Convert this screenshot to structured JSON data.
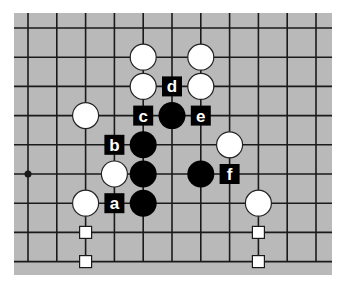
{
  "diagram": {
    "type": "go-board-fragment",
    "grid": {
      "columns": 11,
      "rows": 9
    },
    "colors": {
      "board": "#b9b9b9",
      "line": "#1a1a1a",
      "black_stone": "#000000",
      "white_stone": "#ffffff",
      "label_bg": "#000000",
      "label_text": "#ffffff",
      "marker_fill": "#ffffff"
    },
    "star_points": [
      {
        "col": 0,
        "row": 5
      }
    ],
    "white_stones": [
      {
        "col": 4,
        "row": 1
      },
      {
        "col": 6,
        "row": 1
      },
      {
        "col": 4,
        "row": 2
      },
      {
        "col": 6,
        "row": 2
      },
      {
        "col": 2,
        "row": 3
      },
      {
        "col": 7,
        "row": 4
      },
      {
        "col": 3,
        "row": 5
      },
      {
        "col": 2,
        "row": 6
      },
      {
        "col": 8,
        "row": 6
      }
    ],
    "black_stones": [
      {
        "col": 5,
        "row": 3
      },
      {
        "col": 4,
        "row": 4
      },
      {
        "col": 4,
        "row": 5
      },
      {
        "col": 6,
        "row": 5
      },
      {
        "col": 4,
        "row": 6
      }
    ],
    "labels": [
      {
        "text": "d",
        "col": 5,
        "row": 2
      },
      {
        "text": "c",
        "col": 4,
        "row": 3
      },
      {
        "text": "e",
        "col": 6,
        "row": 3
      },
      {
        "text": "b",
        "col": 3,
        "row": 4
      },
      {
        "text": "f",
        "col": 7,
        "row": 5
      },
      {
        "text": "a",
        "col": 3,
        "row": 6
      }
    ],
    "square_markers": [
      {
        "col": 2,
        "row": 7
      },
      {
        "col": 2,
        "row": 8
      },
      {
        "col": 8,
        "row": 7
      },
      {
        "col": 8,
        "row": 8
      }
    ]
  }
}
